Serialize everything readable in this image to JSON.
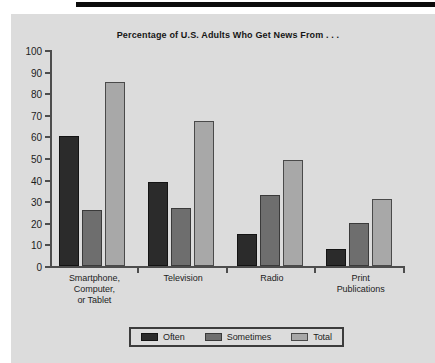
{
  "chart_data": {
    "type": "bar",
    "title": "Percentage of U.S. Adults Who Get News From . . .",
    "xlabel": "",
    "ylabel": "",
    "ylim": [
      0,
      100
    ],
    "yticks": [
      0,
      10,
      20,
      30,
      40,
      50,
      60,
      70,
      80,
      90,
      100
    ],
    "grid": false,
    "legend_position": "bottom",
    "categories": [
      "Smartphone,\nComputer,\nor Tablet",
      "Television",
      "Radio",
      "Print\nPublications"
    ],
    "series": [
      {
        "name": "Often",
        "color": "#2b2b2b",
        "values": [
          60,
          39,
          15,
          8
        ]
      },
      {
        "name": "Sometimes",
        "color": "#6e6e6e",
        "values": [
          26,
          27,
          33,
          20
        ]
      },
      {
        "name": "Total",
        "color": "#a8a8a8",
        "values": [
          85,
          67,
          49,
          31
        ]
      }
    ]
  },
  "legend": {
    "items": [
      {
        "label": "Often"
      },
      {
        "label": "Sometimes"
      },
      {
        "label": "Total"
      }
    ]
  },
  "colors": {
    "panel_background": "#dcdcdc",
    "axis": "#4d4d4d",
    "text": "#1c1c1c",
    "rule": "#0b0b0b"
  }
}
